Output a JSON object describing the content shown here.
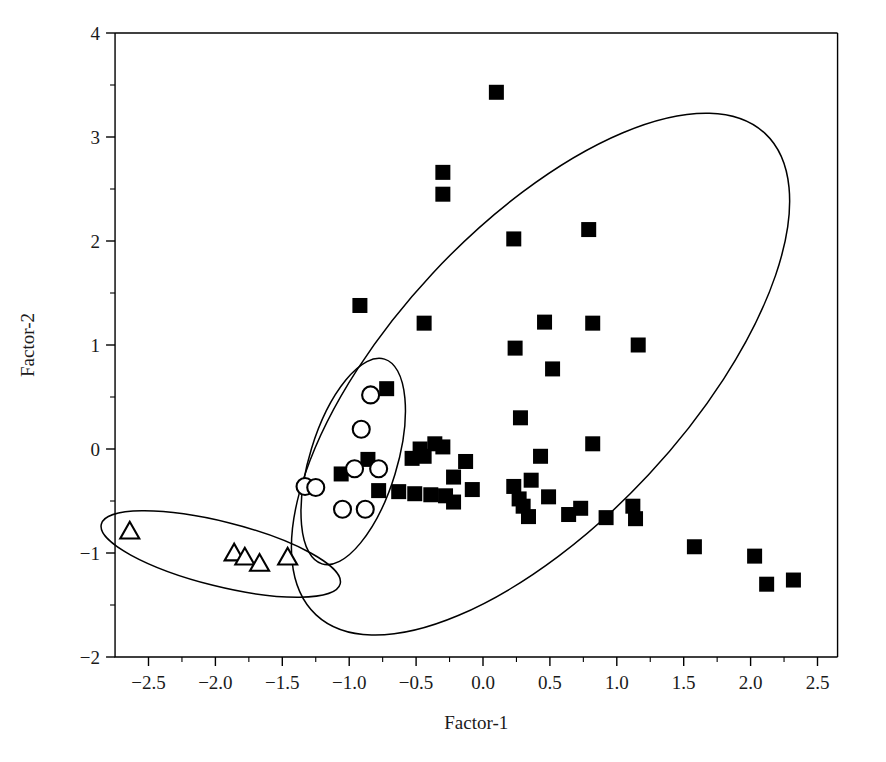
{
  "chart_data": {
    "type": "scatter",
    "title": "",
    "xlabel": "Factor-1",
    "ylabel": "Factor-2",
    "xlim": [
      -2.75,
      2.65
    ],
    "ylim": [
      -2,
      4
    ],
    "grid": false,
    "legend": "none",
    "xticks": [
      -2.5,
      -2.0,
      -1.5,
      -1.0,
      -0.5,
      0.0,
      0.5,
      1.0,
      1.5,
      2.0,
      2.5
    ],
    "xtick_labels": [
      "−2.5",
      "−2.0",
      "−1.5",
      "−1.0",
      "−0.5",
      "0.0",
      "0.5",
      "1.0",
      "1.5",
      "2.0",
      "2.5"
    ],
    "xminor_step": 0.25,
    "yticks": [
      -2,
      -1,
      0,
      1,
      2,
      3,
      4
    ],
    "ytick_labels": [
      "−2",
      "−1",
      "0",
      "1",
      "2",
      "3",
      "4"
    ],
    "yminor_step": 0.5,
    "series": [
      {
        "name": "group-squares",
        "marker": "filled-square",
        "marker_size": 15,
        "color": "#000000",
        "points": [
          [
            0.1,
            3.43
          ],
          [
            -0.3,
            2.66
          ],
          [
            -0.3,
            2.45
          ],
          [
            0.23,
            2.02
          ],
          [
            0.79,
            2.11
          ],
          [
            -0.92,
            1.38
          ],
          [
            -0.44,
            1.21
          ],
          [
            0.24,
            0.97
          ],
          [
            0.46,
            1.22
          ],
          [
            0.82,
            1.21
          ],
          [
            1.16,
            1.0
          ],
          [
            0.52,
            0.77
          ],
          [
            0.28,
            0.3
          ],
          [
            -0.72,
            0.58
          ],
          [
            -0.36,
            0.05
          ],
          [
            -0.3,
            0.02
          ],
          [
            -0.47,
            0.0
          ],
          [
            -0.44,
            -0.07
          ],
          [
            -0.53,
            -0.09
          ],
          [
            -0.13,
            -0.12
          ],
          [
            -1.06,
            -0.24
          ],
          [
            -0.86,
            -0.1
          ],
          [
            -0.22,
            -0.27
          ],
          [
            0.43,
            -0.07
          ],
          [
            0.82,
            0.05
          ],
          [
            -0.63,
            -0.41
          ],
          [
            -0.78,
            -0.4
          ],
          [
            -0.51,
            -0.43
          ],
          [
            -0.39,
            -0.44
          ],
          [
            -0.28,
            -0.45
          ],
          [
            -0.08,
            -0.39
          ],
          [
            0.23,
            -0.36
          ],
          [
            0.36,
            -0.3
          ],
          [
            0.27,
            -0.48
          ],
          [
            0.3,
            -0.55
          ],
          [
            0.49,
            -0.46
          ],
          [
            0.34,
            -0.65
          ],
          [
            -0.22,
            -0.51
          ],
          [
            0.73,
            -0.57
          ],
          [
            0.92,
            -0.66
          ],
          [
            0.64,
            -0.63
          ],
          [
            1.12,
            -0.55
          ],
          [
            1.14,
            -0.67
          ],
          [
            1.58,
            -0.94
          ],
          [
            2.03,
            -1.03
          ],
          [
            2.12,
            -1.3
          ],
          [
            2.32,
            -1.26
          ]
        ]
      },
      {
        "name": "group-circles",
        "marker": "open-circle",
        "marker_size": 17,
        "color": "#000000",
        "points": [
          [
            -0.84,
            0.52
          ],
          [
            -0.91,
            0.19
          ],
          [
            -0.96,
            -0.19
          ],
          [
            -0.78,
            -0.19
          ],
          [
            -1.33,
            -0.36
          ],
          [
            -1.25,
            -0.37
          ],
          [
            -1.05,
            -0.58
          ],
          [
            -0.88,
            -0.58
          ]
        ]
      },
      {
        "name": "group-triangles",
        "marker": "open-triangle",
        "marker_size": 19,
        "color": "#000000",
        "points": [
          [
            -2.64,
            -0.8
          ],
          [
            -1.86,
            -1.01
          ],
          [
            -1.78,
            -1.05
          ],
          [
            -1.67,
            -1.11
          ],
          [
            -1.46,
            -1.05
          ]
        ]
      }
    ],
    "annotations": [
      {
        "name": "ellipse-squares",
        "shape": "ellipse",
        "cx": 0.43,
        "cy": 0.72,
        "rx": 2.46,
        "ry": 1.42,
        "rotation_deg": -47
      },
      {
        "name": "ellipse-circles",
        "shape": "ellipse",
        "cx": -0.97,
        "cy": -0.12,
        "rx": 0.8,
        "ry": 0.42,
        "rotation_deg": -73
      },
      {
        "name": "ellipse-triangles",
        "shape": "ellipse",
        "cx": -1.96,
        "cy": -1.01,
        "rx": 0.92,
        "ry": 0.31,
        "rotation_deg": 14
      }
    ]
  }
}
